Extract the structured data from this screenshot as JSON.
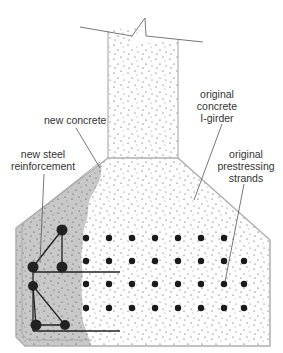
{
  "labels": {
    "new_concrete": "new concrete",
    "new_steel_line1": "new steel",
    "new_steel_line2": "reinforcement",
    "girder_line1": "original",
    "girder_line2": "concrete",
    "girder_line3": "I-girder",
    "strands_line1": "original",
    "strands_line2": "prestressing",
    "strands_line3": "strands"
  },
  "colors": {
    "new_concrete_fill": "#c8c8c8",
    "original_concrete_fill": "#ffffff",
    "outline": "#b0b0b0",
    "strand": "#1a1a1a",
    "leader": "#555555"
  },
  "strands": {
    "rows_y": [
      238,
      261,
      284,
      308
    ],
    "cols_x": [
      86,
      109,
      132,
      155,
      178,
      201,
      224,
      244
    ],
    "row_counts": [
      7,
      8,
      8,
      8
    ]
  },
  "rebar": [
    {
      "x": 62,
      "y": 230
    },
    {
      "x": 33,
      "y": 267
    },
    {
      "x": 62,
      "y": 267
    },
    {
      "x": 33,
      "y": 286
    },
    {
      "x": 36,
      "y": 325
    },
    {
      "x": 65,
      "y": 325
    }
  ]
}
